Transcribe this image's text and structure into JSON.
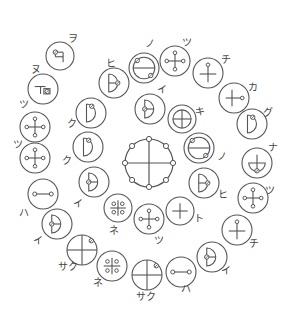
{
  "diagram": {
    "title": "",
    "stroke_color": "#555555",
    "background": "#ffffff",
    "center": {
      "x": 149,
      "y": 163,
      "r": 24,
      "symbol": "center-cross-8-nodes",
      "label": ""
    },
    "symbols": [
      {
        "id": "wo",
        "x": 60,
        "y": 56,
        "r": 14,
        "glyph": "ri-flag",
        "label": "ヲ",
        "lx": 73,
        "ly": 42
      },
      {
        "id": "nu",
        "x": 43,
        "y": 89,
        "r": 15,
        "glyph": "t-box",
        "label": "ヌ",
        "lx": 36,
        "ly": 73
      },
      {
        "id": "tsu1",
        "x": 35,
        "y": 127,
        "r": 15,
        "glyph": "cross-4-nodes",
        "label": "ツ",
        "lx": 24,
        "ly": 108
      },
      {
        "id": "tsu2",
        "x": 35,
        "y": 158,
        "r": 15,
        "glyph": "cross-4-nodes",
        "label": "ツ",
        "lx": 18,
        "ly": 148
      },
      {
        "id": "ha1",
        "x": 43,
        "y": 194,
        "r": 15,
        "glyph": "dumbbell",
        "label": "ハ",
        "lx": 24,
        "ly": 216
      },
      {
        "id": "i1",
        "x": 57,
        "y": 224,
        "r": 15,
        "glyph": "half-left",
        "label": "イ",
        "lx": 38,
        "ly": 244
      },
      {
        "id": "saku1",
        "x": 82,
        "y": 250,
        "r": 15,
        "glyph": "cross-node-ne",
        "label": "サク",
        "lx": 68,
        "ly": 270
      },
      {
        "id": "ne1",
        "x": 112,
        "y": 266,
        "r": 15,
        "glyph": "four-dots",
        "label": "ネ",
        "lx": 98,
        "ly": 286
      },
      {
        "id": "saku2",
        "x": 147,
        "y": 275,
        "r": 15,
        "glyph": "cross-node-ne",
        "label": "サク",
        "lx": 146,
        "ly": 300
      },
      {
        "id": "ha2",
        "x": 181,
        "y": 272,
        "r": 15,
        "glyph": "dumbbell",
        "label": "ハ",
        "lx": 186,
        "ly": 292
      },
      {
        "id": "i2",
        "x": 212,
        "y": 257,
        "r": 15,
        "glyph": "half-left",
        "label": "イ",
        "lx": 226,
        "ly": 274
      },
      {
        "id": "chi1",
        "x": 237,
        "y": 230,
        "r": 15,
        "glyph": "cross-node-top",
        "label": "チ",
        "lx": 254,
        "ly": 247
      },
      {
        "id": "tsu3",
        "x": 253,
        "y": 198,
        "r": 15,
        "glyph": "cross-4-nodes",
        "label": "ツ",
        "lx": 270,
        "ly": 194
      },
      {
        "id": "na",
        "x": 257,
        "y": 163,
        "r": 15,
        "glyph": "bowl",
        "label": "ナ",
        "lx": 273,
        "ly": 151
      },
      {
        "id": "gu",
        "x": 252,
        "y": 124,
        "r": 15,
        "glyph": "d-shape",
        "label": "グ",
        "lx": 268,
        "ly": 116
      },
      {
        "id": "ka",
        "x": 234,
        "y": 98,
        "r": 15,
        "glyph": "cross-node-right",
        "label": "カ",
        "lx": 253,
        "ly": 91
      },
      {
        "id": "chi2",
        "x": 208,
        "y": 73,
        "r": 15,
        "glyph": "cross-node-top",
        "label": "チ",
        "lx": 226,
        "ly": 63
      },
      {
        "id": "tsu4",
        "x": 175,
        "y": 61,
        "r": 15,
        "glyph": "cross-4-nodes",
        "label": "ツ",
        "lx": 187,
        "ly": 46
      },
      {
        "id": "no1",
        "x": 144,
        "y": 68,
        "r": 15,
        "glyph": "theta-nodes",
        "label": "ノ",
        "lx": 150,
        "ly": 47
      },
      {
        "id": "hi1",
        "x": 114,
        "y": 83,
        "r": 15,
        "glyph": "d-half-right",
        "label": "ヒ",
        "lx": 111,
        "ly": 67
      },
      {
        "id": "ku1",
        "x": 91,
        "y": 113,
        "r": 15,
        "glyph": "d-shape",
        "label": "ク",
        "lx": 72,
        "ly": 127
      },
      {
        "id": "ku2",
        "x": 88,
        "y": 147,
        "r": 15,
        "glyph": "d-shape",
        "label": "ク",
        "lx": 67,
        "ly": 164
      },
      {
        "id": "i3",
        "x": 94,
        "y": 182,
        "r": 15,
        "glyph": "half-left",
        "label": "イ",
        "lx": 78,
        "ly": 207
      },
      {
        "id": "ne2",
        "x": 118,
        "y": 208,
        "r": 14,
        "glyph": "four-dots",
        "label": "ネ",
        "lx": 114,
        "ly": 234
      },
      {
        "id": "tsu5",
        "x": 149,
        "y": 219,
        "r": 15,
        "glyph": "cross-4-nodes",
        "label": "ツ",
        "lx": 159,
        "ly": 244
      },
      {
        "id": "to",
        "x": 180,
        "y": 211,
        "r": 14,
        "glyph": "cross",
        "label": "ト",
        "lx": 199,
        "ly": 222
      },
      {
        "id": "hi2",
        "x": 204,
        "y": 183,
        "r": 15,
        "glyph": "d-half-right",
        "label": "ヒ",
        "lx": 223,
        "ly": 198
      },
      {
        "id": "no2",
        "x": 199,
        "y": 148,
        "r": 15,
        "glyph": "theta-nodes",
        "label": "ノ",
        "lx": 222,
        "ly": 160
      },
      {
        "id": "ki",
        "x": 182,
        "y": 119,
        "r": 14,
        "glyph": "double-ring-cross",
        "label": "キ",
        "lx": 200,
        "ly": 115
      },
      {
        "id": "i4",
        "x": 150,
        "y": 109,
        "r": 15,
        "glyph": "half-left",
        "label": "イ",
        "lx": 162,
        "ly": 93
      }
    ]
  }
}
